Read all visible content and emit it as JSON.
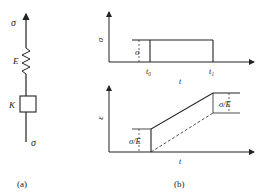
{
  "panel_a": {
    "caption": "(a)",
    "top_label": "σ",
    "bottom_label": "σ",
    "spring_label": "E",
    "dashpot_label": "K"
  },
  "panel_b": {
    "caption": "(b)",
    "stress_plot": {
      "ylabel": "σ",
      "xlabel": "t",
      "level_label": "σ",
      "t0_label": "t₀",
      "t1_label": "t₁"
    },
    "strain_plot": {
      "ylabel": "ε",
      "xlabel": "t",
      "left_step_label": "σ/E",
      "right_step_label": "σ/E"
    }
  },
  "colors": {
    "ink": "#222222",
    "background": "#ffffff"
  }
}
